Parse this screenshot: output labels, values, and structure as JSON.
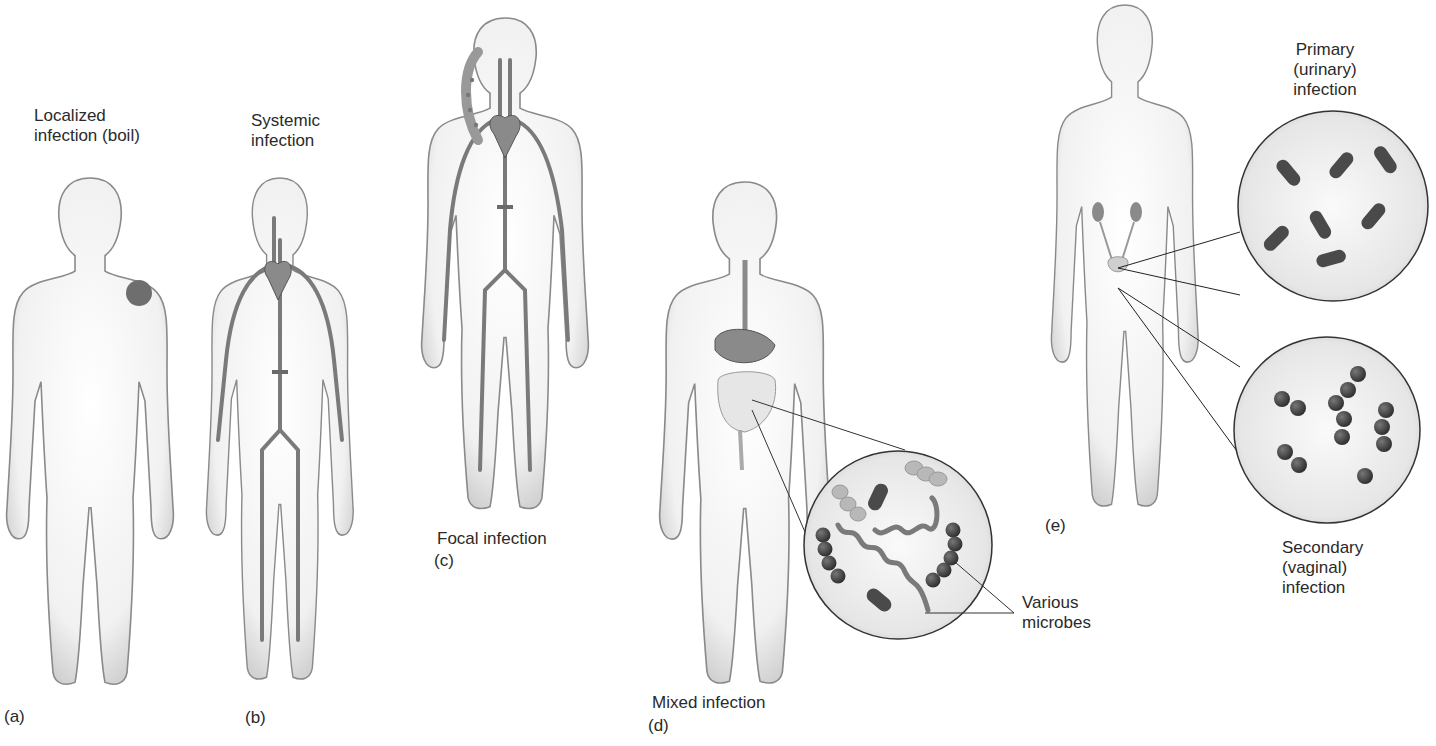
{
  "panels": {
    "a": {
      "letter": "(a)",
      "title": "Localized\ninfection (boil)"
    },
    "b": {
      "letter": "(b)",
      "title": "Systemic\ninfection"
    },
    "c": {
      "letter": "(c)",
      "title": "Focal infection"
    },
    "d": {
      "letter": "(d)",
      "title": "Mixed infection",
      "callout": "Various\nmicrobes"
    },
    "e": {
      "letter": "(e)",
      "primary": "Primary\n(urinary)\ninfection",
      "secondary": "Secondary\n(vaginal)\ninfection"
    }
  },
  "colors": {
    "body_fill": "#f4f4f4",
    "body_outline": "#8a8a8a",
    "vessel": "#7a7a7a",
    "boil": "#6e6e6e",
    "microbe_dark": "#4a4a4a",
    "microbe_light": "#b8b8b8",
    "lens_fill": "#eeeeee"
  }
}
